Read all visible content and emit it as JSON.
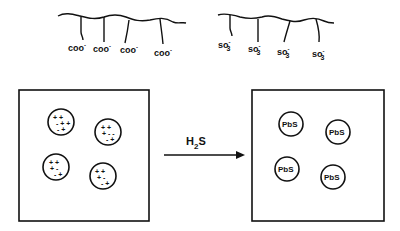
{
  "diagram": {
    "polymers": [
      {
        "name": "carboxylate-polymer",
        "group_label": "coo",
        "charge": "-",
        "count": 4
      },
      {
        "name": "sulfonate-polymer",
        "group_label": "so",
        "subscript": "3",
        "charge": "-",
        "count": 4
      }
    ],
    "left_box": {
      "particle_count": 4,
      "particle_content": "+ / - charges"
    },
    "arrow": {
      "reagent": "H",
      "reagent_sub": "2",
      "reagent_tail": "S"
    },
    "right_box": {
      "particle_count": 4,
      "particle_label": "PbS"
    },
    "colors": {
      "ink": "#111111",
      "background": "#ffffff"
    }
  }
}
